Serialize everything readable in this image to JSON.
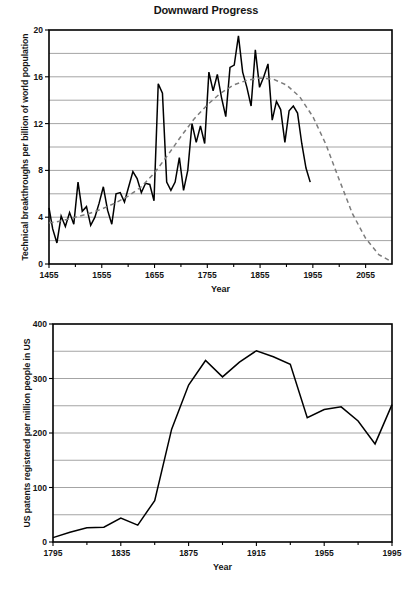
{
  "page": {
    "background": "#ffffff",
    "line_color": "#000000",
    "trend_color": "#7c7c7c",
    "grid_color": "#9a9a9a"
  },
  "chart_data": [
    {
      "id": "downward-progress",
      "type": "line",
      "title": "Downward Progress",
      "xlabel": "Year",
      "ylabel": "Technical breakthroughs per billion of world population",
      "xlim": [
        1455,
        2105
      ],
      "ylim": [
        0,
        20
      ],
      "xticks": [
        1455,
        1555,
        1655,
        1755,
        1855,
        1955,
        2055
      ],
      "xtick_labels": [
        "1455",
        "1555",
        "1655",
        "1755",
        "1855",
        "1955",
        "2055"
      ],
      "yticks": [
        0,
        4,
        8,
        12,
        16,
        20
      ],
      "ytick_labels": [
        "0",
        "4",
        "8",
        "12",
        "16",
        "20"
      ],
      "y_gridlines": [
        2,
        4,
        6,
        8,
        10,
        12,
        14,
        16,
        18
      ],
      "grid": true,
      "legend": "none",
      "series": [
        {
          "name": "Technical breakthroughs per billion of world population",
          "style": "solid",
          "x": [
            1455,
            1462,
            1470,
            1478,
            1486,
            1494,
            1502,
            1510,
            1518,
            1526,
            1534,
            1542,
            1550,
            1558,
            1566,
            1574,
            1582,
            1590,
            1598,
            1606,
            1614,
            1622,
            1630,
            1638,
            1646,
            1654,
            1662,
            1670,
            1678,
            1686,
            1694,
            1702,
            1710,
            1718,
            1726,
            1734,
            1742,
            1750,
            1758,
            1766,
            1774,
            1782,
            1790,
            1798,
            1806,
            1814,
            1822,
            1830,
            1838,
            1846,
            1854,
            1862,
            1870,
            1878,
            1886,
            1894,
            1902,
            1910,
            1918,
            1926,
            1934,
            1942,
            1950,
            1958,
            1966,
            1974,
            1982,
            1990
          ],
          "y": [
            4.8,
            3.0,
            1.8,
            4.1,
            3.2,
            4.4,
            3.4,
            7.0,
            4.5,
            4.9,
            3.3,
            4.0,
            5.2,
            6.6,
            4.6,
            3.4,
            6.0,
            6.1,
            5.3,
            6.6,
            7.9,
            7.3,
            6.1,
            6.9,
            6.8,
            5.4,
            15.4,
            14.6,
            7.0,
            6.3,
            7.0,
            9.1,
            6.3,
            8.0,
            12.0,
            10.4,
            11.8,
            10.3,
            16.4,
            14.8,
            16.2,
            14.2,
            12.6,
            16.8,
            17.0,
            19.5,
            16.4,
            15.1,
            13.5,
            18.3,
            15.1,
            16.0,
            17.1,
            12.3,
            13.9,
            13.2,
            10.4,
            13.1,
            13.5,
            12.9,
            10.3,
            8.2,
            7.0,
            null,
            null,
            null,
            null,
            null
          ]
        },
        {
          "name": "trend",
          "style": "dashed",
          "x": [
            1455,
            1480,
            1505,
            1530,
            1555,
            1580,
            1605,
            1630,
            1655,
            1680,
            1705,
            1730,
            1755,
            1780,
            1805,
            1830,
            1855,
            1880,
            1905,
            1930,
            1955,
            1980,
            2005,
            2030,
            2055,
            2080,
            2100
          ],
          "y": [
            3.5,
            3.7,
            4.0,
            4.3,
            4.7,
            5.2,
            5.8,
            6.6,
            7.8,
            9.3,
            10.9,
            12.4,
            13.6,
            14.6,
            15.3,
            15.7,
            15.9,
            15.8,
            15.3,
            14.3,
            12.6,
            10.2,
            7.2,
            4.3,
            2.2,
            0.8,
            0.3
          ]
        }
      ]
    },
    {
      "id": "us-patents",
      "type": "line",
      "title": "",
      "xlabel": "Year",
      "ylabel": "US patents registered per million people in US",
      "xlim": [
        1795,
        1995
      ],
      "ylim": [
        0,
        400
      ],
      "xticks": [
        1795,
        1835,
        1875,
        1915,
        1955,
        1995
      ],
      "xtick_labels": [
        "1795",
        "1835",
        "1875",
        "1915",
        "1955",
        "1995"
      ],
      "yticks": [
        0,
        100,
        200,
        300,
        400
      ],
      "ytick_labels": [
        "0",
        "100",
        "200",
        "300",
        "400"
      ],
      "y_gridlines": [
        50,
        100,
        150,
        200,
        250,
        300,
        350
      ],
      "grid": true,
      "legend": "none",
      "series": [
        {
          "name": "US patents registered per million people in US",
          "style": "solid",
          "x": [
            1795,
            1805,
            1815,
            1825,
            1835,
            1845,
            1855,
            1865,
            1875,
            1885,
            1895,
            1905,
            1915,
            1925,
            1935,
            1945,
            1955,
            1965,
            1975,
            1985,
            1995
          ],
          "y": [
            8,
            18,
            26,
            27,
            44,
            31,
            76,
            207,
            288,
            333,
            303,
            330,
            351,
            340,
            326,
            228,
            243,
            248,
            222,
            180,
            252
          ]
        }
      ]
    }
  ]
}
